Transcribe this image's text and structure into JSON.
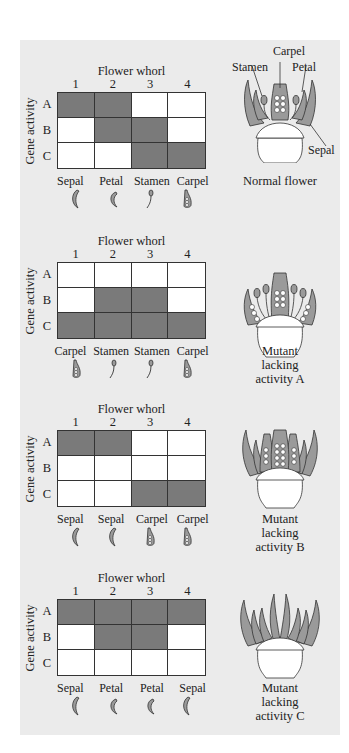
{
  "axis": {
    "x_title": "Flower whorl",
    "columns": [
      "1",
      "2",
      "3",
      "4"
    ],
    "y_title": "Gene activity",
    "rows": [
      "A",
      "B",
      "C"
    ]
  },
  "colors": {
    "panel_bg": "#ebebeb",
    "active_cell": "#7a7a7a",
    "inactive_cell": "#ffffff",
    "organ_fill": "#9a9a9a"
  },
  "panels": [
    {
      "caption": "Normal flower",
      "grid": [
        [
          1,
          1,
          0,
          0
        ],
        [
          0,
          1,
          1,
          0
        ],
        [
          0,
          0,
          1,
          1
        ]
      ],
      "organs": [
        "Sepal",
        "Petal",
        "Stamen",
        "Carpel"
      ],
      "callouts": {
        "carpel": "Carpel",
        "stamen": "Stamen",
        "petal": "Petal",
        "sepal": "Sepal"
      }
    },
    {
      "caption": "Mutant lacking activity A",
      "caption_lines": [
        "Mutant",
        "lacking",
        "activity A"
      ],
      "grid": [
        [
          0,
          0,
          0,
          0
        ],
        [
          0,
          1,
          1,
          0
        ],
        [
          1,
          1,
          1,
          1
        ]
      ],
      "organs": [
        "Carpel",
        "Stamen",
        "Stamen",
        "Carpel"
      ]
    },
    {
      "caption": "Mutant lacking activity B",
      "caption_lines": [
        "Mutant",
        "lacking",
        "activity B"
      ],
      "grid": [
        [
          1,
          1,
          0,
          0
        ],
        [
          0,
          0,
          0,
          0
        ],
        [
          0,
          0,
          1,
          1
        ]
      ],
      "organs": [
        "Sepal",
        "Sepal",
        "Carpel",
        "Carpel"
      ]
    },
    {
      "caption": "Mutant lacking activity C",
      "caption_lines": [
        "Mutant",
        "lacking",
        "activity C"
      ],
      "grid": [
        [
          1,
          1,
          1,
          1
        ],
        [
          0,
          1,
          1,
          0
        ],
        [
          0,
          0,
          0,
          0
        ]
      ],
      "organs": [
        "Sepal",
        "Petal",
        "Petal",
        "Sepal"
      ]
    }
  ]
}
